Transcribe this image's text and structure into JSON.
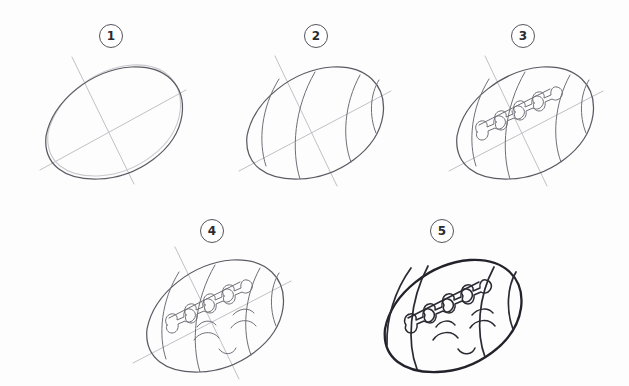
{
  "sheet": {
    "title": "How to draw a cartoon football - 5 step tutorial",
    "background_color": "#ffffff",
    "sketch_color": "#5a5a63",
    "guide_color": "#b9b9bf",
    "ink_color": "#22222a",
    "width": 629,
    "height": 386
  },
  "steps": [
    {
      "number": "1",
      "badge_label": "1",
      "name": "step-1-oval-base",
      "description": "Draw a tilted pointed oval (lens) shape with two crossing guide lines.",
      "badge": {
        "x": 99,
        "y": 24
      },
      "art": {
        "x": 24,
        "y": 50,
        "w": 180,
        "h": 140
      },
      "elements": [
        "long-axis-guide",
        "short-axis-guide",
        "ball-outline-sketch",
        "ball-outline-ghost"
      ]
    },
    {
      "number": "2",
      "badge_label": "2",
      "name": "step-2-seam-stripes",
      "description": "Add three curved stripe lines wrapping around the ball.",
      "badge": {
        "x": 304,
        "y": 24
      },
      "art": {
        "x": 228,
        "y": 50,
        "w": 180,
        "h": 140
      },
      "elements": [
        "long-axis-guide",
        "short-axis-guide",
        "ball-outline-sketch",
        "stripe-1",
        "stripe-2",
        "stripe-3",
        "center-seam"
      ]
    },
    {
      "number": "3",
      "badge_label": "3",
      "name": "step-3-laces",
      "description": "Add the laces (stitching) along the central seam line.",
      "badge": {
        "x": 511,
        "y": 24
      },
      "art": {
        "x": 435,
        "y": 50,
        "w": 180,
        "h": 140
      },
      "elements": [
        "long-axis-guide",
        "short-axis-guide",
        "ball-outline-sketch",
        "stripes",
        "center-seam",
        "laces"
      ]
    },
    {
      "number": "4",
      "badge_label": "4",
      "name": "step-4-face",
      "description": "Add the happy face: two closed curved eyes, eyebrows and a smiling mouth.",
      "badge": {
        "x": 200,
        "y": 219
      },
      "art": {
        "x": 126,
        "y": 244,
        "w": 190,
        "h": 140
      },
      "elements": [
        "long-axis-guide",
        "short-axis-guide",
        "ball-outline-sketch",
        "stripes",
        "laces",
        "eyebrows",
        "eyes",
        "smile"
      ]
    },
    {
      "number": "5",
      "badge_label": "5",
      "name": "step-5-final-inked",
      "description": "Erase the guide lines and ink the finished cartoon football.",
      "badge": {
        "x": 430,
        "y": 219
      },
      "art": {
        "x": 358,
        "y": 244,
        "w": 200,
        "h": 140
      },
      "elements": [
        "ball-outline-ink",
        "stripe-bands",
        "laces",
        "eyebrows",
        "eyes",
        "smile"
      ]
    }
  ]
}
